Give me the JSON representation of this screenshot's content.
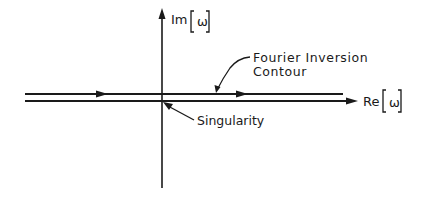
{
  "diagram": {
    "axes": {
      "imaginary": {
        "label": "Im",
        "variable": "ω"
      },
      "real": {
        "label": "Re",
        "variable": "ω"
      }
    },
    "annotations": {
      "contour_line1": "Fourier Inversion",
      "contour_line2": "Contour",
      "singularity": "Singularity"
    },
    "colors": {
      "ink": "#1a1a1a",
      "background": "#ffffff"
    }
  }
}
